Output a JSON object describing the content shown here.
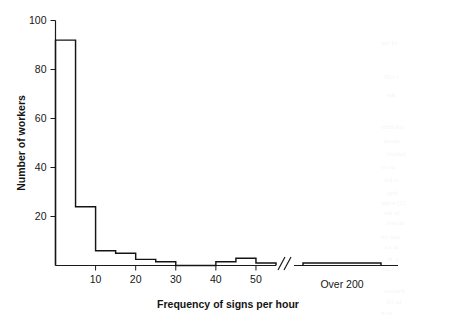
{
  "chart_data": {
    "type": "bar",
    "title": "",
    "subtitle": "",
    "xlabel": "Frequency of signs per hour",
    "ylabel": "Number of workers",
    "ylim": [
      0,
      100
    ],
    "yticks": [
      0,
      20,
      40,
      60,
      80,
      100
    ],
    "ytick_labels": [
      "",
      "20",
      "40",
      "60",
      "80",
      "100"
    ],
    "xticks": [
      10,
      20,
      30,
      40,
      50
    ],
    "xtick_labels": [
      "10",
      "20",
      "30",
      "40",
      "50"
    ],
    "xlim": [
      0,
      55
    ],
    "bin_width": 5,
    "grid": false,
    "legend": null,
    "axis_break": {
      "present": true,
      "symbol": "//",
      "after_value": 55,
      "note": "x-axis broken between the 55 bin and the Over 200 group"
    },
    "categories": [
      "0-5",
      "5-10",
      "10-15",
      "15-20",
      "20-25",
      "25-30",
      "30-35",
      "35-40",
      "40-45",
      "45-50",
      "50-55"
    ],
    "values": [
      92,
      24,
      6,
      5,
      2.5,
      1.5,
      0,
      0,
      1.5,
      3,
      1
    ],
    "overflow_group": {
      "label": "Over 200",
      "categories": [
        "over-200-a",
        "over-200-b",
        "over-200-c",
        "over-200-d"
      ],
      "values": [
        1,
        1,
        1,
        1
      ]
    },
    "bar_style": {
      "fill": "none",
      "stroke": "#141414",
      "stroke_width": 1.45
    }
  },
  "figure": {
    "background": "#ffffff",
    "ink_color": "#141414"
  },
  "bleed_text": {
    "lines": [
      "of the",
      "t will",
      "the",
      "rall time",
      "mean",
      "behavi",
      "ue to",
      "ct for",
      "ling",
      "(2) some",
      "in the",
      "drawn",
      "und on",
      "in a s",
      "e. in",
      "atic",
      "Further",
      "in 10",
      "tion"
    ]
  }
}
